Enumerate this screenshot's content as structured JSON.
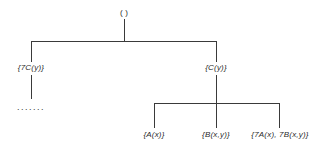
{
  "diagram": {
    "type": "tree",
    "root": {
      "label": "( )"
    },
    "level1": [
      {
        "label": "{7C(y)}",
        "children_placeholder": "......."
      },
      {
        "label": "{C(y)}"
      }
    ],
    "level2": [
      {
        "label": "{A(x)}"
      },
      {
        "label": "{B(x,y)}"
      },
      {
        "label": "{7A(x), 7B(x,y)}"
      }
    ]
  }
}
